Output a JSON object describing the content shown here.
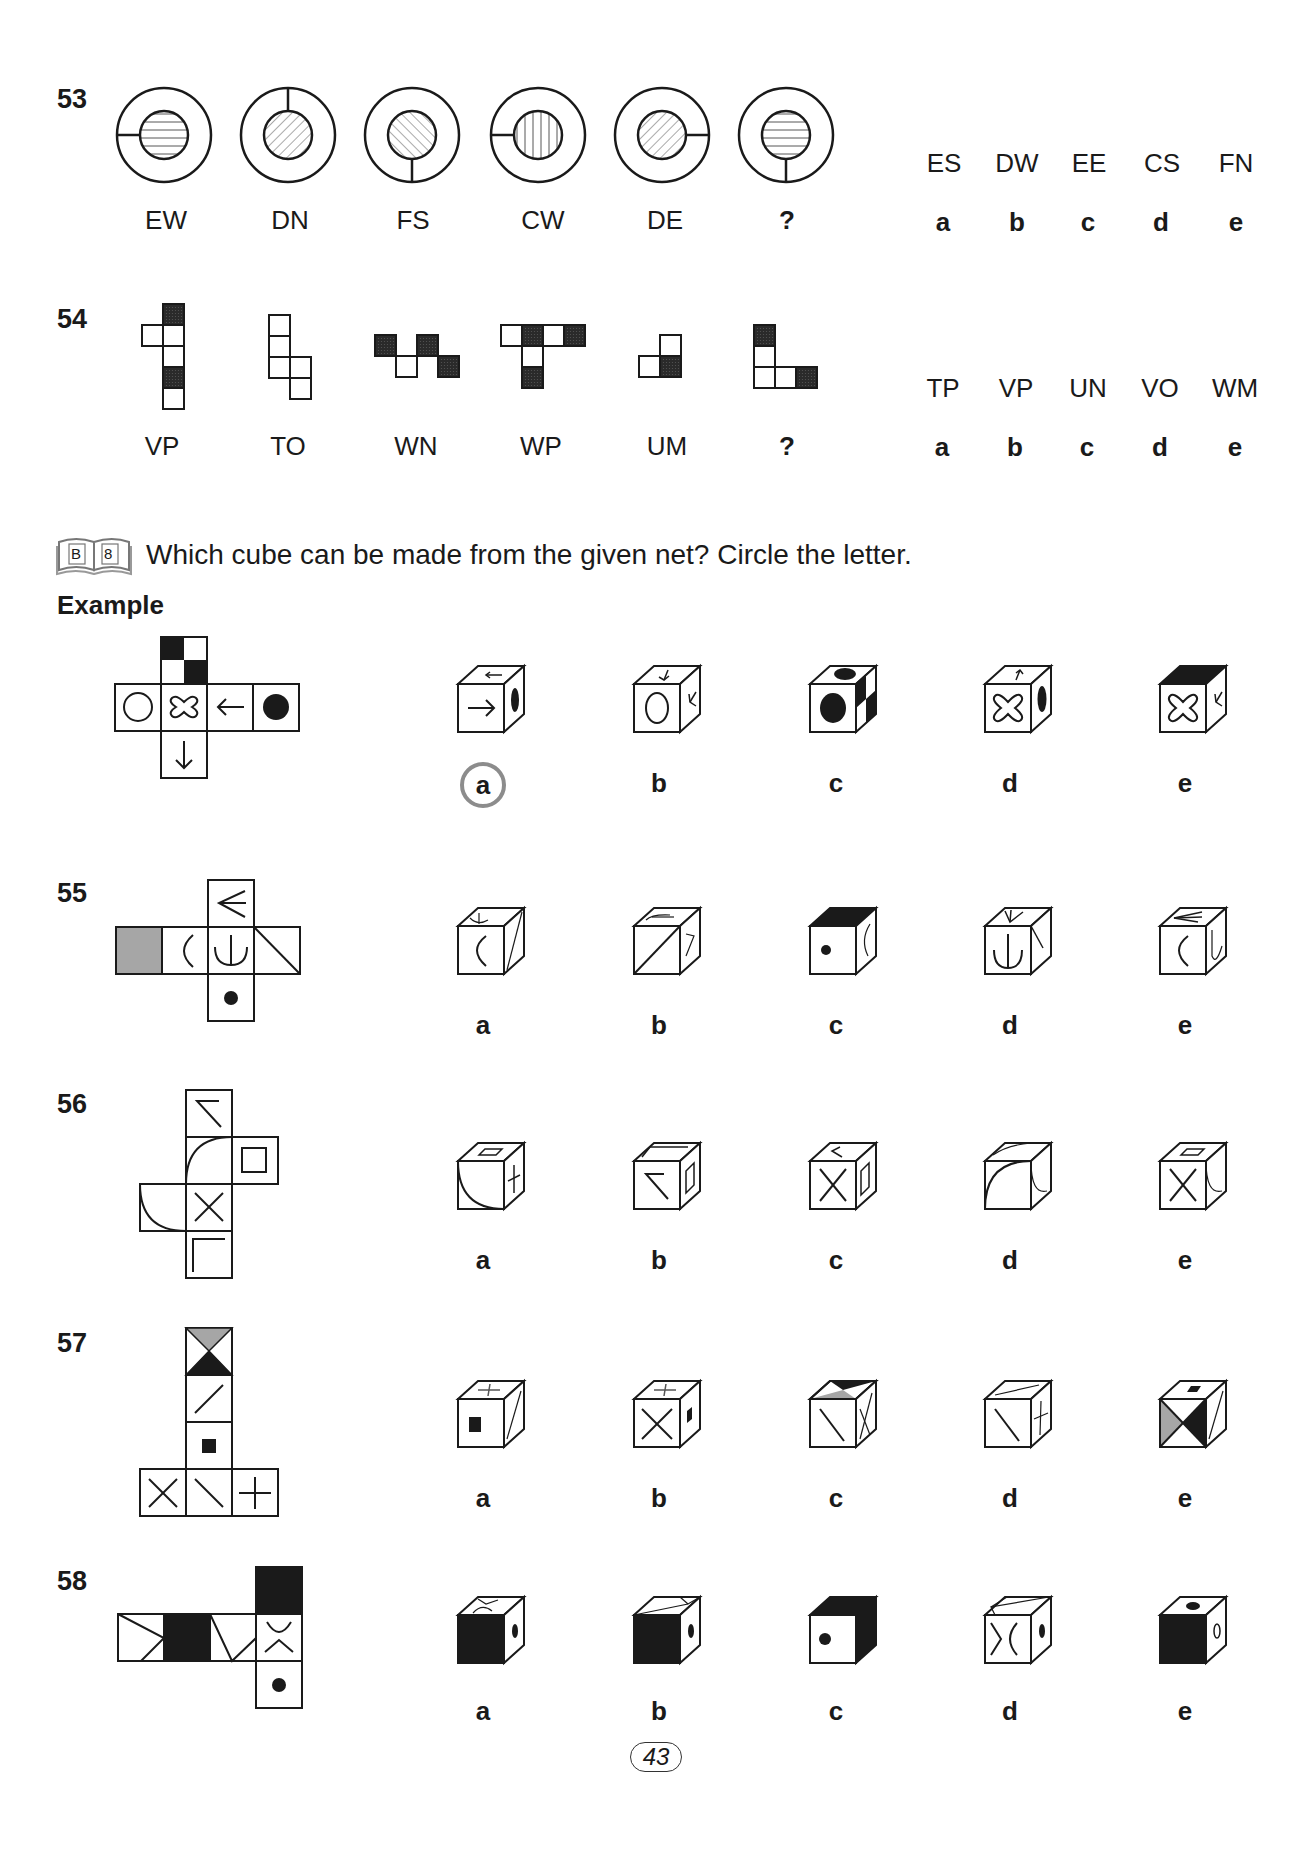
{
  "page_number": "43",
  "questions": {
    "q53": {
      "number": "53",
      "figure_codes": [
        "EW",
        "DN",
        "FS",
        "CW",
        "DE",
        "?"
      ],
      "figure_descriptions": [
        "ring with left notch, inner circle horizontal stripes",
        "ring with top notch, inner circle diagonal stripes (\\)",
        "ring with bottom notch, inner circle diagonal stripes (/)",
        "ring with left notch, inner circle vertical stripes",
        "ring with right notch, inner circle diagonal stripes (\\)",
        "ring with bottom notch, inner circle horizontal stripes"
      ],
      "options": [
        {
          "letter": "a",
          "code": "ES"
        },
        {
          "letter": "b",
          "code": "DW"
        },
        {
          "letter": "c",
          "code": "EE"
        },
        {
          "letter": "d",
          "code": "CS"
        },
        {
          "letter": "e",
          "code": "FN"
        }
      ]
    },
    "q54": {
      "number": "54",
      "figure_codes": [
        "VP",
        "TO",
        "WN",
        "WP",
        "UM",
        "?"
      ],
      "options": [
        {
          "letter": "a",
          "code": "TP"
        },
        {
          "letter": "b",
          "code": "VP"
        },
        {
          "letter": "c",
          "code": "UN"
        },
        {
          "letter": "d",
          "code": "VO"
        },
        {
          "letter": "e",
          "code": "WM"
        }
      ]
    },
    "cube_section": {
      "book_icon_labels": [
        "B",
        "8"
      ],
      "instruction": "Which cube can be made from the given net? Circle the letter.",
      "example_label": "Example",
      "example_option_letters": [
        "a",
        "b",
        "c",
        "d",
        "e"
      ],
      "example_circled_answer": "a"
    },
    "q55": {
      "number": "55",
      "option_letters": [
        "a",
        "b",
        "c",
        "d",
        "e"
      ]
    },
    "q56": {
      "number": "56",
      "option_letters": [
        "a",
        "b",
        "c",
        "d",
        "e"
      ]
    },
    "q57": {
      "number": "57",
      "option_letters": [
        "a",
        "b",
        "c",
        "d",
        "e"
      ]
    },
    "q58": {
      "number": "58",
      "option_letters": [
        "a",
        "b",
        "c",
        "d",
        "e"
      ]
    }
  },
  "colors": {
    "ink": "#1a1a1a",
    "grey_fill": "#a6a6a6",
    "circle_highlight": "#8c8c8c"
  }
}
